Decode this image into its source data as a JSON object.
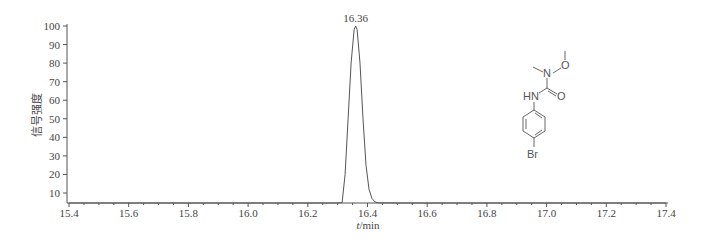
{
  "chart_data": {
    "type": "line",
    "title": "",
    "xlabel": "t/min",
    "xlabel_italic_part": "t",
    "xlabel_rest": "/min",
    "ylabel": "信号强度",
    "xlim": [
      15.4,
      17.4
    ],
    "ylim": [
      4.6,
      100
    ],
    "x_major_ticks": [
      15.4,
      15.6,
      15.8,
      16.0,
      16.2,
      16.4,
      16.6,
      16.8,
      17.0,
      17.2,
      17.4
    ],
    "x_tick_labels": [
      "15.4",
      "15.6",
      "15.8",
      "16.0",
      "16.2",
      "16.4",
      "16.6",
      "16.8",
      "17.0",
      "17.2",
      "17.4"
    ],
    "x_minor_tick_step": 0.05,
    "y_ticks": [
      10,
      20,
      30,
      40,
      50,
      60,
      70,
      80,
      90,
      100
    ],
    "y_tick_labels": [
      "10",
      "20",
      "30",
      "40",
      "50",
      "60",
      "70",
      "80",
      "90",
      "100"
    ],
    "grid": false,
    "legend": null,
    "series": [
      {
        "name": "chromatogram",
        "x": [
          15.4,
          16.0,
          16.3,
          16.315,
          16.325,
          16.335,
          16.345,
          16.355,
          16.36,
          16.365,
          16.375,
          16.385,
          16.395,
          16.405,
          16.415,
          16.425,
          16.435,
          16.5,
          17.4
        ],
        "y": [
          4.6,
          4.6,
          4.6,
          4.8,
          20,
          50,
          80,
          98,
          100,
          98,
          80,
          50,
          25,
          12,
          7,
          5.2,
          4.7,
          4.6,
          4.6
        ]
      }
    ],
    "annotations": [
      {
        "text": "16.36",
        "x": 16.36,
        "y": 100,
        "type": "peak-label"
      }
    ],
    "inset": {
      "type": "chemical-structure",
      "labels": [
        "O",
        "N",
        "HN",
        "O",
        "Br"
      ]
    }
  }
}
